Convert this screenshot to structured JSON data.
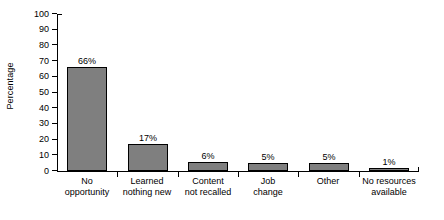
{
  "chart_data": {
    "type": "bar",
    "title": "",
    "xlabel": "",
    "ylabel": "Percentage",
    "ylim": [
      0,
      100
    ],
    "ytick_step": 10,
    "grid": false,
    "legend": null,
    "bar_color": "#7f7f7f",
    "bar_edge_color": "#000000",
    "categories": [
      "No\nopportunity",
      "Learned\nnothing new",
      "Content\nnot recalled",
      "Job\nchange",
      "Other",
      "No resources\navailable"
    ],
    "values": [
      66,
      17,
      6,
      5,
      5,
      1
    ],
    "data_labels": [
      "66%",
      "17%",
      "6%",
      "5%",
      "5%",
      "1%"
    ],
    "yticks": [
      0,
      10,
      20,
      30,
      40,
      50,
      60,
      70,
      80,
      90,
      100
    ],
    "ytick_labels": [
      "0",
      "10",
      "20",
      "30",
      "40",
      "50",
      "60",
      "70",
      "80",
      "90",
      "100"
    ]
  }
}
